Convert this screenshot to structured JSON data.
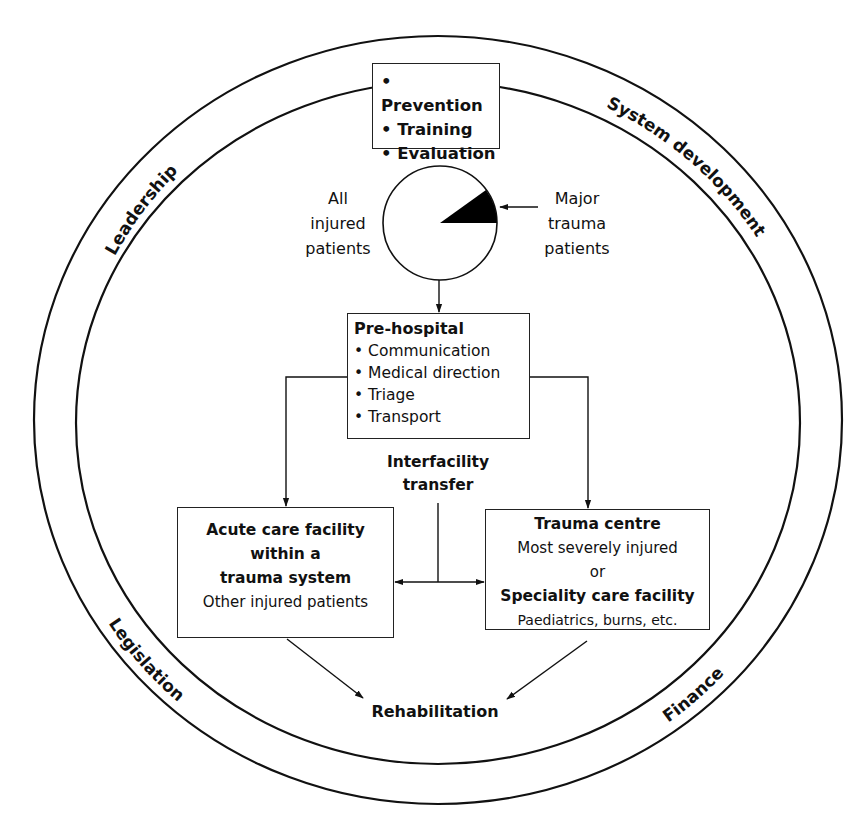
{
  "diagram": {
    "ring_labels": {
      "top_left": "Leadership",
      "top_right": "System development",
      "bottom_left": "Legislation",
      "bottom_right": "Finance"
    },
    "top_box": {
      "items": [
        "Prevention",
        "Training",
        "Evaluation"
      ]
    },
    "population": {
      "left_label": [
        "All",
        "injured",
        "patients"
      ],
      "right_label": [
        "Major",
        "trauma",
        "patients"
      ],
      "highlighted_slice_fraction": 0.1
    },
    "prehospital": {
      "title": "Pre-hospital",
      "items": [
        "Communication",
        "Medical direction",
        "Triage",
        "Transport"
      ]
    },
    "interfacility": {
      "label": [
        "Interfacility",
        "transfer"
      ]
    },
    "acute_care": {
      "title_lines": [
        "Acute care facility",
        "within a",
        "trauma system"
      ],
      "subtitle": "Other injured patients"
    },
    "trauma_centre": {
      "title": "Trauma centre",
      "subtitle": "Most severely injured",
      "connector": "or",
      "alt_title": "Speciality care facility",
      "alt_subtitle": "Paediatrics, burns, etc."
    },
    "rehabilitation": {
      "label": "Rehabilitation"
    },
    "colors": {
      "stroke": "#222222",
      "fill_slice": "#000000",
      "background": "#ffffff"
    }
  }
}
